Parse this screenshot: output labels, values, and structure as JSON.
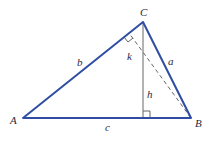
{
  "diagram": {
    "type": "triangle",
    "colors": {
      "sides": "#2f4ea3",
      "altitude": "#666666",
      "dashed": "#666666",
      "text": "#2a2a3a"
    },
    "vertices": {
      "A": {
        "label": "A",
        "x": 23,
        "y": 118
      },
      "B": {
        "label": "B",
        "x": 191,
        "y": 118
      },
      "C": {
        "label": "C",
        "x": 143,
        "y": 22
      }
    },
    "sides": {
      "a": "a",
      "b": "b",
      "c": "c"
    },
    "segments": {
      "h": "h",
      "k": "k"
    }
  }
}
